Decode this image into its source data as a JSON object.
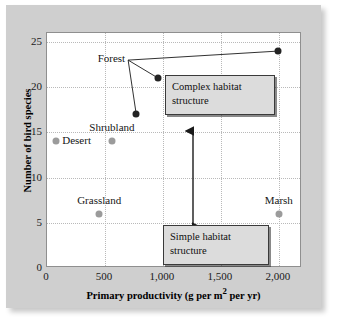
{
  "chart_data": {
    "type": "scatter",
    "title": "",
    "xlabel": "Primary productivity (g per m² per yr)",
    "ylabel": "Number of bird species",
    "xlim": [
      0,
      2200
    ],
    "ylim": [
      0,
      26
    ],
    "xticks": [
      0,
      500,
      1000,
      1500,
      2000
    ],
    "xticklabels": [
      "0",
      "500",
      "1,000",
      "1,500",
      "2,000"
    ],
    "yticks": [
      0,
      5,
      10,
      15,
      20,
      25
    ],
    "yticklabels": [
      "0",
      "5",
      "10",
      "15",
      "20",
      "25"
    ],
    "grid": true,
    "legend": "none",
    "points": [
      {
        "name": "Desert",
        "x": 80,
        "y": 14,
        "color": "#9b9b9b",
        "label": "Desert",
        "label_pos": "right"
      },
      {
        "name": "Shrubland",
        "x": 560,
        "y": 14,
        "color": "#9b9b9b",
        "label": "Shrubland",
        "label_pos": "above"
      },
      {
        "name": "Grassland",
        "x": 450,
        "y": 6,
        "color": "#9b9b9b",
        "label": "Grassland",
        "label_pos": "above"
      },
      {
        "name": "Marsh",
        "x": 2000,
        "y": 6,
        "color": "#9b9b9b",
        "label": "Marsh",
        "label_pos": "above"
      },
      {
        "name": "Forest-1",
        "x": 770,
        "y": 17,
        "color": "#242424",
        "label": "",
        "label_pos": "none"
      },
      {
        "name": "Forest-2",
        "x": 960,
        "y": 21,
        "color": "#242424",
        "label": "",
        "label_pos": "none"
      },
      {
        "name": "Forest-3",
        "x": 1995,
        "y": 24,
        "color": "#242424",
        "label": "",
        "label_pos": "none"
      }
    ],
    "group_label": {
      "text": "Forest",
      "x": 700,
      "y": 23,
      "connects_to": [
        "Forest-1",
        "Forest-2",
        "Forest-3"
      ]
    },
    "annotations": [
      {
        "name": "complex-habitat",
        "text_line1": "Complex habitat",
        "text_line2": "structure"
      },
      {
        "name": "simple-habitat",
        "text_line1": "Simple habitat",
        "text_line2": "structure"
      }
    ],
    "arrow": {
      "name": "habitat-structure-arrow",
      "double_headed": true
    }
  },
  "colors": {
    "panel_background": "#cfcfcf",
    "plot_background": "#ffffff",
    "grid": "#b9b9b9",
    "dark_point": "#242424",
    "light_point": "#9b9b9b",
    "callout_fill": "#dcdcdc",
    "callout_border": "#3a3a3a"
  }
}
